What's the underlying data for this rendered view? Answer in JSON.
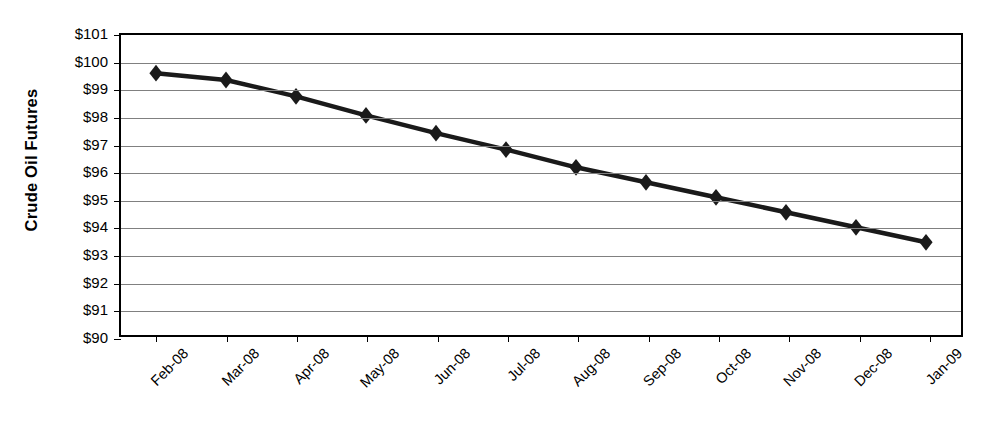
{
  "chart_data": {
    "type": "line",
    "title": "",
    "xlabel": "",
    "ylabel": "Crude Oil Futures",
    "categories": [
      "Feb-08",
      "Mar-08",
      "Apr-08",
      "May-08",
      "Jun-08",
      "Jul-08",
      "Aug-08",
      "Sep-08",
      "Oct-08",
      "Nov-08",
      "Dec-08",
      "Jan-09"
    ],
    "values": [
      99.6,
      99.35,
      98.75,
      98.05,
      97.4,
      96.8,
      96.15,
      95.6,
      95.05,
      94.5,
      93.95,
      93.4
    ],
    "ylim": [
      90,
      101
    ],
    "ytick_values": [
      101,
      100,
      99,
      98,
      97,
      96,
      95,
      94,
      93,
      92,
      91,
      90
    ],
    "ytick_labels": [
      "$101",
      "$100",
      "$99",
      "$98",
      "$97",
      "$96",
      "$95",
      "$94",
      "$93",
      "$92",
      "$91",
      "$90"
    ],
    "grid": "horizontal",
    "legend": "none",
    "marker": "diamond",
    "series_color": "#1a1a1a",
    "gridline_color": "#808080",
    "axis_color": "#000000",
    "background_color": "#ffffff",
    "xtick_label_rotation": -45
  }
}
